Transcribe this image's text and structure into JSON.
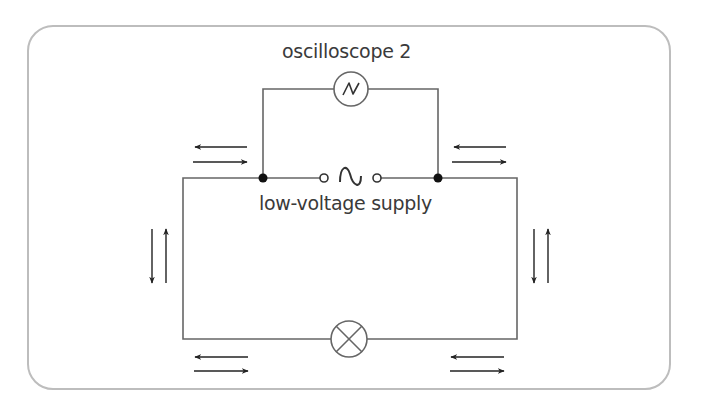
{
  "diagram": {
    "type": "circuit",
    "labels": {
      "oscilloscope": "oscilloscope 2",
      "supply": "low-voltage supply"
    },
    "components": [
      {
        "name": "oscilloscope 2",
        "symbol": "circle-with-sine",
        "position": "top-branch"
      },
      {
        "name": "low-voltage supply",
        "symbol": "ac-source",
        "position": "top-main-wire"
      },
      {
        "name": "lamp",
        "symbol": "circle-with-cross",
        "position": "bottom-wire"
      }
    ],
    "arrows": [
      {
        "location": "top-left",
        "pair": [
          "left",
          "right"
        ]
      },
      {
        "location": "top-right",
        "pair": [
          "left",
          "right"
        ]
      },
      {
        "location": "left-side",
        "pair": [
          "down",
          "up"
        ]
      },
      {
        "location": "right-side",
        "pair": [
          "down",
          "up"
        ]
      },
      {
        "location": "bottom-left",
        "pair": [
          "left",
          "right"
        ]
      },
      {
        "location": "bottom-right",
        "pair": [
          "left",
          "right"
        ]
      }
    ],
    "colors": {
      "wire": "#666666",
      "arrow": "#222222",
      "frame": "#bdbdbd",
      "text": "#3a3a3a"
    }
  }
}
